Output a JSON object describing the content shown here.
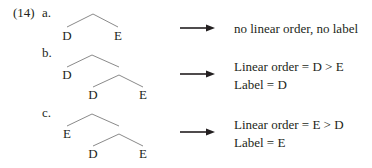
{
  "example_number": "(14)",
  "examples": [
    {
      "letter": "a.",
      "tree": {
        "nodes": [
          "D",
          "E"
        ]
      },
      "result_lines": [
        "no linear order, no label"
      ]
    },
    {
      "letter": "b.",
      "tree": {
        "nodes": [
          "D",
          "D",
          "E"
        ]
      },
      "result_lines": [
        "Linear order = D > E",
        "Label = D"
      ]
    },
    {
      "letter": "c.",
      "tree": {
        "nodes": [
          "E",
          "D",
          "E"
        ]
      },
      "result_lines": [
        "Linear order = E > D",
        "Label = E"
      ]
    }
  ],
  "colors": {
    "text": "#231f20",
    "tree_line": "#8a8a8a",
    "arrow": "#231f20"
  }
}
